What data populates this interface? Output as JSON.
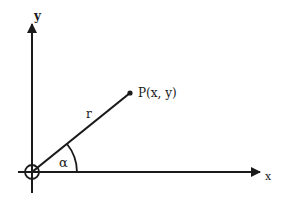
{
  "diagram": {
    "type": "polar-coordinate-diagram",
    "axes": {
      "x_label": "x",
      "y_label": "y"
    },
    "point": {
      "label": "P(x, y)"
    },
    "radius_label": "r",
    "angle_label": "α",
    "colors": {
      "stroke": "#1a1a1a",
      "background": "#ffffff"
    }
  }
}
